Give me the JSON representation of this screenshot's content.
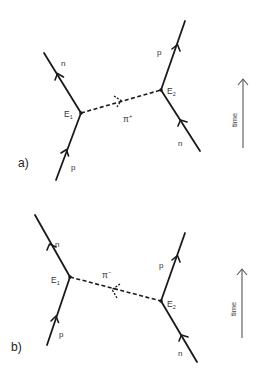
{
  "diagram": {
    "type": "Feynman diagrams of nucleon-pion exchange",
    "panels": [
      {
        "label": "a)",
        "vertices": [
          {
            "name": "E",
            "sub": "1"
          },
          {
            "name": "E",
            "sub": "2"
          }
        ],
        "incoming_left": "p",
        "outgoing_left": "n",
        "incoming_right": "n",
        "outgoing_right": "p",
        "exchange": {
          "symbol": "π",
          "charge": "+",
          "direction": "E1 → E2"
        },
        "time_label": "time"
      },
      {
        "label": "b)",
        "vertices": [
          {
            "name": "E",
            "sub": "1"
          },
          {
            "name": "E",
            "sub": "2"
          }
        ],
        "incoming_left": "p",
        "outgoing_left": "n",
        "incoming_right": "n",
        "outgoing_right": "p",
        "exchange": {
          "symbol": "π",
          "charge": "−",
          "direction": "E2 → E1"
        },
        "time_label": "time"
      }
    ]
  },
  "colors": {
    "line": "#1a1a1a",
    "background": "#ffffff"
  }
}
